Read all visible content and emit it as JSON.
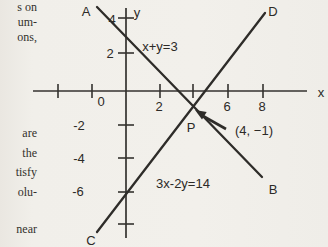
{
  "colors": {
    "background": "#f1efea",
    "ink": "#2e2c29",
    "margin_text": "#33312c"
  },
  "margin_text": {
    "fragments": [
      {
        "text": "s on",
        "top": 0
      },
      {
        "text": "um-",
        "top": 15
      },
      {
        "text": "ons,",
        "top": 30
      },
      {
        "text": "are",
        "top": 126
      },
      {
        "text": "the",
        "top": 146
      },
      {
        "text": "tisfy",
        "top": 165
      },
      {
        "text": "olu-",
        "top": 185
      },
      {
        "text": "near",
        "top": 222
      }
    ]
  },
  "graph": {
    "x_axis": {
      "x1": 33,
      "y1": 91,
      "x2": 307,
      "y2": 91,
      "label": "x",
      "label_x": 321,
      "label_y": 97
    },
    "y_axis": {
      "x1": 126,
      "y1": 8,
      "x2": 126,
      "y2": 238,
      "label": "y",
      "label_x": 137,
      "label_y": 17
    },
    "origin": {
      "label": "0",
      "x": 101,
      "y": 106
    },
    "x_ticks": [
      {
        "x": 58
      },
      {
        "x": 92
      },
      {
        "x": 160,
        "label": "2",
        "lx": 159,
        "ly": 111
      },
      {
        "x": 193
      },
      {
        "x": 228,
        "label": "6",
        "lx": 227,
        "ly": 111
      },
      {
        "x": 263,
        "label": "8",
        "lx": 262,
        "ly": 111
      }
    ],
    "y_ticks": [
      {
        "y": 18,
        "label": "4",
        "lx": 112,
        "ly": 24
      },
      {
        "y": 53,
        "label": "2",
        "lx": 110,
        "ly": 58
      },
      {
        "y": 125,
        "label": "-2",
        "lx": 79,
        "ly": 130
      },
      {
        "y": 158,
        "label": "-4",
        "lx": 79,
        "ly": 163
      },
      {
        "y": 192,
        "label": "-6",
        "lx": 78,
        "ly": 196
      },
      {
        "y": 224
      }
    ],
    "lines": [
      {
        "id": "AB",
        "equation": "x+y=3",
        "x1": 97,
        "y1": 7,
        "x2": 262,
        "y2": 177,
        "eq_x": 160,
        "eq_y": 51,
        "endpoints": [
          {
            "label": "A",
            "x": 86,
            "y": 16
          },
          {
            "label": "B",
            "x": 273,
            "y": 194
          }
        ]
      },
      {
        "id": "CD",
        "equation": "3x-2y=14",
        "x1": 97,
        "y1": 232,
        "x2": 265,
        "y2": 13,
        "eq_x": 183,
        "eq_y": 188,
        "endpoints": [
          {
            "label": "C",
            "x": 91,
            "y": 245
          },
          {
            "label": "D",
            "x": 273,
            "y": 16
          }
        ]
      }
    ],
    "intersection": {
      "label": "P",
      "label_x": 191,
      "label_y": 132,
      "annotation": "(4, −1)",
      "annotation_x": 254,
      "annotation_y": 135,
      "arrow": {
        "tail_x": 226,
        "tail_y": 129,
        "head_x": 203,
        "head_y": 116,
        "head_poly": "195,110 206.7,111.9 202,119.5"
      }
    }
  }
}
